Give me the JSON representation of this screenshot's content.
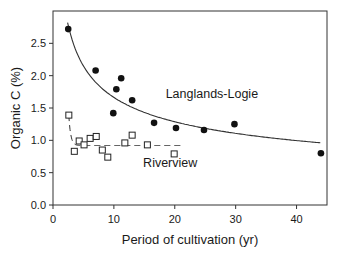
{
  "chart_data": {
    "type": "scatter",
    "title": "",
    "xlabel": "Period of cultivation (yr)",
    "ylabel": "Organic C (%)",
    "xlim": [
      0,
      45
    ],
    "ylim": [
      0,
      3.0
    ],
    "xticks": [
      0,
      10,
      20,
      30,
      40
    ],
    "xtick_labels": [
      "0",
      "10",
      "20",
      "30",
      "40"
    ],
    "yticks": [
      0.0,
      0.5,
      1.0,
      1.5,
      2.0,
      2.5
    ],
    "ytick_labels": [
      "0.0",
      "0.5",
      "1.0",
      "1.5",
      "2.0",
      "2.5"
    ],
    "grid": false,
    "legend": "none (inline annotations)",
    "series": [
      {
        "name": "Langlands-Logie",
        "marker": "filled-circle",
        "points": [
          {
            "x": 2.5,
            "y": 2.72
          },
          {
            "x": 7.0,
            "y": 2.08
          },
          {
            "x": 9.9,
            "y": 1.42
          },
          {
            "x": 10.4,
            "y": 1.79
          },
          {
            "x": 11.2,
            "y": 1.96
          },
          {
            "x": 13.0,
            "y": 1.62
          },
          {
            "x": 16.6,
            "y": 1.27
          },
          {
            "x": 20.2,
            "y": 1.19
          },
          {
            "x": 24.8,
            "y": 1.16
          },
          {
            "x": 29.8,
            "y": 1.25
          },
          {
            "x": 44.0,
            "y": 0.8
          }
        ],
        "fit": {
          "style": "solid",
          "form": "power",
          "a": 3.9,
          "b": -0.37,
          "x_range": [
            2.4,
            44
          ]
        }
      },
      {
        "name": "Riverview",
        "marker": "open-square",
        "points": [
          {
            "x": 2.6,
            "y": 1.39
          },
          {
            "x": 3.5,
            "y": 0.83
          },
          {
            "x": 4.3,
            "y": 0.99
          },
          {
            "x": 5.1,
            "y": 0.93
          },
          {
            "x": 6.1,
            "y": 1.03
          },
          {
            "x": 7.1,
            "y": 1.06
          },
          {
            "x": 8.1,
            "y": 0.85
          },
          {
            "x": 9.0,
            "y": 0.74
          },
          {
            "x": 11.8,
            "y": 0.96
          },
          {
            "x": 13.0,
            "y": 1.08
          },
          {
            "x": 15.5,
            "y": 0.93
          },
          {
            "x": 19.9,
            "y": 0.79
          }
        ],
        "fit": {
          "style": "dashed",
          "form": "exponential-decay-to-plateau",
          "plateau": 0.92,
          "x_range": [
            2.6,
            21
          ]
        }
      }
    ],
    "annotations": [
      {
        "text": "Langlands-Logie",
        "x": 18.5,
        "y": 1.65
      },
      {
        "text": "Riverview",
        "x": 14.8,
        "y": 0.58
      }
    ]
  }
}
